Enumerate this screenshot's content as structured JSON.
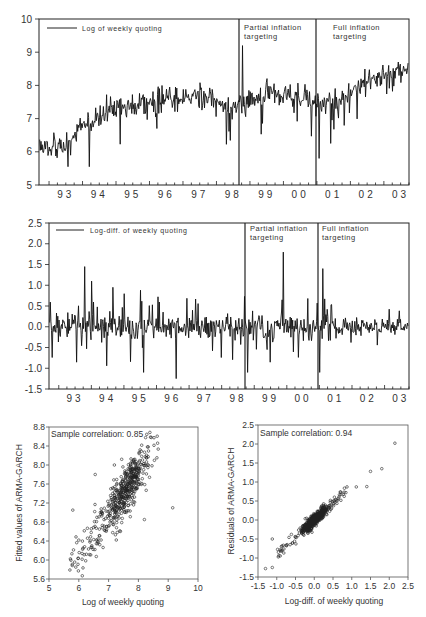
{
  "chart_data": [
    {
      "id": "panel1",
      "type": "line",
      "title": "",
      "legend": "Log of weekly quoting",
      "xlabel": "",
      "ylabel": "",
      "ylim": [
        5,
        10
      ],
      "yticks": [
        5,
        6,
        7,
        8,
        9,
        10
      ],
      "x_tick_labels": [
        "93",
        "94",
        "95",
        "96",
        "97",
        "98",
        "99",
        "00",
        "01",
        "02",
        "03"
      ],
      "annotations": [
        {
          "text": "Partial inflation targeting",
          "at": "late 1998"
        },
        {
          "text": "Full inflation targeting",
          "at": "early 2001"
        }
      ],
      "regime_lines": [
        "1998.8",
        "2001.0"
      ],
      "series": [
        {
          "name": "Log of weekly quoting",
          "approx_yearly_levels": {
            "93": 6.2,
            "94": 7.1,
            "95": 7.4,
            "96": 7.6,
            "97": 7.7,
            "98": 7.3,
            "99": 7.8,
            "00": 7.6,
            "01": 7.4,
            "02": 8.1,
            "03": 8.5
          },
          "notable": {
            "max": 9.2,
            "max_at": "1998.8",
            "min": 5.6,
            "min_at": "1993.2",
            "min_2001": 5.8
          }
        }
      ]
    },
    {
      "id": "panel2",
      "type": "line",
      "title": "",
      "legend": "Log-diff. of weekly quoting",
      "xlabel": "",
      "ylabel": "",
      "ylim": [
        -1.5,
        2.5
      ],
      "yticks": [
        "-1.5",
        "-1.0",
        "-0.5",
        "0.0",
        "0.5",
        "1.0",
        "1.5",
        "2.0",
        "2.5"
      ],
      "x_tick_labels": [
        "93",
        "94",
        "95",
        "96",
        "97",
        "98",
        "99",
        "00",
        "01",
        "02",
        "03"
      ],
      "annotations": [
        {
          "text": "Partial inflation targeting",
          "at": "late 1998"
        },
        {
          "text": "Full inflation targeting",
          "at": "early 2001"
        }
      ],
      "regime_lines": [
        "1998.8",
        "2001.0"
      ],
      "series": [
        {
          "name": "Log-diff. of weekly quoting",
          "notable_spikes": [
            {
              "at": "1993.8",
              "value": 1.45
            },
            {
              "at": "1994.0",
              "value": 1.1
            },
            {
              "at": "1998.8",
              "value": 2.2
            },
            {
              "at": "1999.9",
              "value": 1.8
            },
            {
              "at": "2001.1",
              "value": 1.4
            },
            {
              "at": "1996.6",
              "value": -1.25
            },
            {
              "at": "1995.6",
              "value": -1.1
            },
            {
              "at": "1998.8",
              "value": -1.1
            },
            {
              "at": "2001.0",
              "value": -1.1
            }
          ],
          "typical_range": [
            -0.5,
            0.5
          ]
        }
      ]
    },
    {
      "id": "panel3",
      "type": "scatter",
      "title": "",
      "annotation": "Sample correlation: 0.85",
      "xlabel": "Log of weekly quoting",
      "ylabel": "Fitted values of ARMA-GARCH",
      "xlim": [
        5,
        10
      ],
      "ylim": [
        5.6,
        8.8
      ],
      "xticks": [
        "5",
        "6",
        "7",
        "8",
        "9",
        "10"
      ],
      "yticks": [
        "5.6",
        "6.0",
        "6.4",
        "6.8",
        "7.2",
        "7.6",
        "8.0",
        "8.4",
        "8.8"
      ],
      "correlation": 0.85,
      "cloud": {
        "center": [
          7.6,
          7.5
        ],
        "slope": 0.85,
        "spread": 0.25,
        "outliers": [
          [
            9.15,
            7.1
          ],
          [
            5.8,
            7.05
          ],
          [
            6.55,
            7.8
          ],
          [
            5.9,
            5.85
          ],
          [
            8.2,
            6.85
          ]
        ]
      }
    },
    {
      "id": "panel4",
      "type": "scatter",
      "title": "",
      "annotation": "Sample correlation: 0.94",
      "xlabel": "Log-diff. of weekly quoting",
      "ylabel": "Residuals of ARMA-GARCH",
      "xlim": [
        -1.5,
        2.5
      ],
      "ylim": [
        -1.5,
        2.5
      ],
      "xticks": [
        "-1.5",
        "-1.0",
        "-0.5",
        "0.0",
        "0.5",
        "1.0",
        "1.5",
        "2.0",
        "2.5"
      ],
      "yticks": [
        "-1.5",
        "-1.0",
        "-0.5",
        "0.0",
        "0.5",
        "1.0",
        "1.5",
        "2.0",
        "2.5"
      ],
      "correlation": 0.94,
      "cloud": {
        "center": [
          0.0,
          0.0
        ],
        "slope": 0.9,
        "spread": 0.08,
        "outliers": [
          [
            2.15,
            2.02
          ],
          [
            1.8,
            1.35
          ],
          [
            1.5,
            1.28
          ],
          [
            1.4,
            0.88
          ],
          [
            1.12,
            0.87
          ],
          [
            -1.12,
            -0.5
          ],
          [
            -1.3,
            -1.28
          ],
          [
            -1.12,
            -1.25
          ]
        ]
      }
    }
  ],
  "panels": {
    "p1": {
      "legend": "Log of weekly quoting",
      "partial": [
        "Partial inflation",
        "targeting"
      ],
      "full": [
        "Full inflation",
        "targeting"
      ]
    },
    "p2": {
      "legend": "Log-diff. of weekly quoting",
      "partial": [
        "Partial inflation",
        "targeting"
      ],
      "full": [
        "Full inflation",
        "targeting"
      ]
    },
    "p3": {
      "corr": "Sample correlation: 0.85",
      "xlabel": "Log of weekly quoting",
      "ylabel": "Fitted values of ARMA-GARCH"
    },
    "p4": {
      "corr": "Sample correlation: 0.94",
      "xlabel": "Log-diff. of weekly quoting",
      "ylabel": "Residuals of ARMA-GARCH"
    }
  }
}
